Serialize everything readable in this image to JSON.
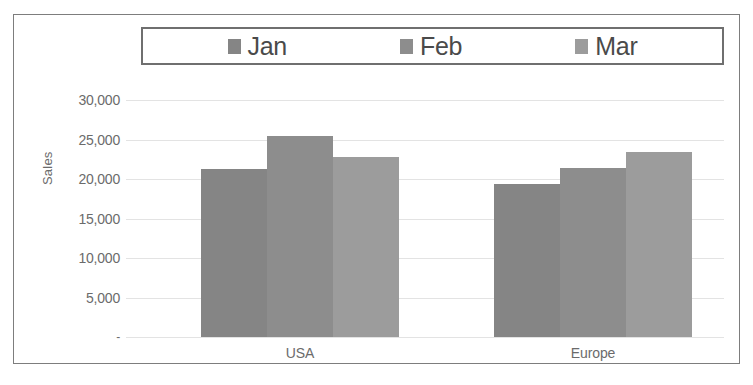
{
  "chart_data": {
    "type": "bar",
    "title": "",
    "xlabel": "",
    "ylabel": "Sales",
    "categories": [
      "USA",
      "Europe"
    ],
    "series": [
      {
        "name": "Jan",
        "values": [
          21300,
          19350
        ],
        "color": "#858585"
      },
      {
        "name": "Feb",
        "values": [
          25400,
          21400
        ],
        "color": "#8d8d8d"
      },
      {
        "name": "Mar",
        "values": [
          22850,
          23400
        ],
        "color": "#9c9c9c"
      }
    ],
    "ylim": [
      0,
      30000
    ],
    "y_ticks": [
      {
        "value": 30000,
        "label": "30,000"
      },
      {
        "value": 25000,
        "label": "25,000"
      },
      {
        "value": 20000,
        "label": "20,000"
      },
      {
        "value": 15000,
        "label": "15,000"
      },
      {
        "value": 10000,
        "label": "10,000"
      },
      {
        "value": 5000,
        "label": "5,000"
      },
      {
        "value": 0,
        "label": "-"
      }
    ],
    "grid": true,
    "legend_position": "top",
    "grid_color": "#e3e3e3",
    "text_color": "#6b6b6b",
    "frame_color": "#7d7d7d"
  },
  "legend": {
    "entries": [
      {
        "label": "Jan"
      },
      {
        "label": "Feb"
      },
      {
        "label": "Mar"
      }
    ]
  },
  "axes": {
    "y_title": "Sales",
    "x_categories": [
      "USA",
      "Europe"
    ]
  }
}
